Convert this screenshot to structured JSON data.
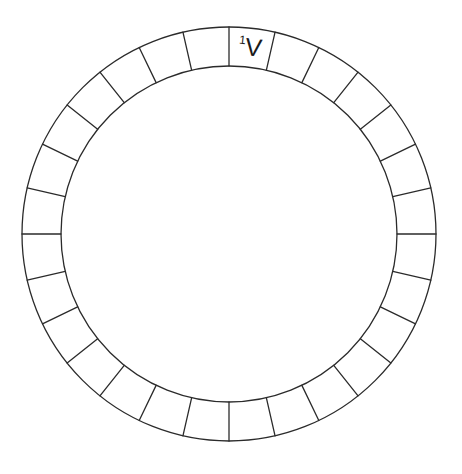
{
  "canvas": {
    "width": 462,
    "height": 474,
    "background_color": "#ffffff"
  },
  "figure": {
    "type": "segmented-annulus",
    "title": "",
    "stroke_color": "#2b2b2b",
    "fill_color": "#ffffff",
    "text_color": "#1a1a1a",
    "stroke_width": 1.3
  },
  "ring": {
    "center_x": 229,
    "center_y": 234,
    "outer_radius": 207,
    "inner_radius": 168,
    "segment_count": 28,
    "start_angle_deg": -90,
    "segment_span_deg": 12.857142857142858
  },
  "labels": [
    {
      "segment_index": 0,
      "text": "1V",
      "superscript": "1",
      "base": "V",
      "align": "left"
    }
  ],
  "chart_data": {
    "type": "pie",
    "title": "",
    "xlabel": "",
    "ylabel": "",
    "categories": [
      "1",
      "2",
      "3",
      "4",
      "5",
      "6",
      "7",
      "8",
      "9",
      "10",
      "11",
      "12",
      "13",
      "14",
      "15",
      "16",
      "17",
      "18",
      "19",
      "20",
      "21",
      "22",
      "23",
      "24",
      "25",
      "26",
      "27",
      "28"
    ],
    "values": [
      1,
      1,
      1,
      1,
      1,
      1,
      1,
      1,
      1,
      1,
      1,
      1,
      1,
      1,
      1,
      1,
      1,
      1,
      1,
      1,
      1,
      1,
      1,
      1,
      1,
      1,
      1,
      1
    ],
    "annotations": [
      "1V"
    ],
    "legend": "none",
    "grid": false
  }
}
